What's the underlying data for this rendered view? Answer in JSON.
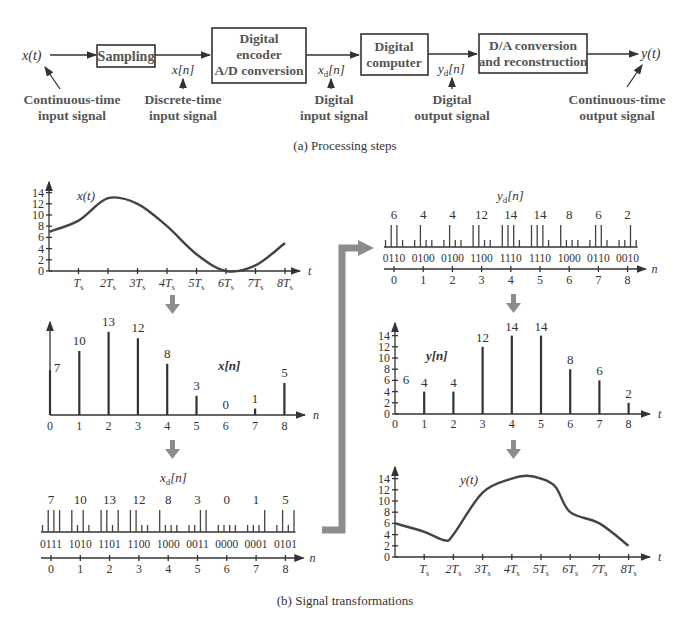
{
  "block_diagram": {
    "input_label": "x(t)",
    "output_label": "y(t)",
    "blocks": [
      {
        "id": "sampling",
        "lines": [
          "Sampling"
        ]
      },
      {
        "id": "encoder",
        "lines": [
          "Digital",
          "encoder",
          "A/D conversion"
        ]
      },
      {
        "id": "computer",
        "lines": [
          "Digital",
          "computer"
        ]
      },
      {
        "id": "dac",
        "lines": [
          "D/A conversion",
          "and reconstruction"
        ]
      }
    ],
    "signal_labels": {
      "xn": "x[n]",
      "xdn": "x",
      "xdn_sub": "d",
      "xdn_tail": "[n]",
      "ydn": "y",
      "ydn_sub": "d",
      "ydn_tail": "[n]"
    },
    "annotations": [
      {
        "id": "cont-input",
        "lines": [
          "Continuous-time",
          "input signal"
        ]
      },
      {
        "id": "disc-input",
        "lines": [
          "Discrete-time",
          "input signal"
        ]
      },
      {
        "id": "dig-input",
        "lines": [
          "Digital",
          "input signal"
        ]
      },
      {
        "id": "dig-output",
        "lines": [
          "Digital",
          "output signal"
        ]
      },
      {
        "id": "cont-output",
        "lines": [
          "Continuous-time",
          "output signal"
        ]
      }
    ],
    "caption": "(a)  Processing steps"
  },
  "transformations": {
    "caption": "(b)  Signal transformations",
    "y_ticks": [
      "0",
      "2",
      "4",
      "6",
      "8",
      "10",
      "12",
      "14"
    ],
    "n_ticks": [
      "0",
      "1",
      "2",
      "3",
      "4",
      "5",
      "6",
      "7",
      "8"
    ],
    "t_ticks": [
      "T",
      "2T",
      "3T",
      "4T",
      "5T",
      "6T",
      "7T",
      "8T"
    ],
    "t_tick_sub": "s",
    "t_axis": "t",
    "n_axis": "n",
    "xt_label": "x(t)",
    "xn_label": "x[n]",
    "xdn_label": "x",
    "xdn_label_sub": "d",
    "xdn_label_tail": "[n]",
    "ydn_label": "y",
    "ydn_label_sub": "d",
    "ydn_label_tail": "[n]",
    "yn_label": "y[n]",
    "yt_label": "y(t)"
  },
  "chart_data": [
    {
      "type": "line",
      "title": "x(t)",
      "xlabel": "t",
      "ylabel": "",
      "ylim": [
        0,
        14
      ],
      "x": [
        0,
        1,
        2,
        3,
        4,
        5,
        6,
        7,
        8
      ],
      "values": [
        7,
        9,
        13,
        12,
        8,
        3,
        0,
        1,
        5
      ]
    },
    {
      "type": "bar",
      "title": "x[n]",
      "xlabel": "n",
      "categories": [
        "0",
        "1",
        "2",
        "3",
        "4",
        "5",
        "6",
        "7",
        "8"
      ],
      "values": [
        7,
        10,
        13,
        12,
        8,
        3,
        0,
        1,
        5
      ]
    },
    {
      "type": "table",
      "title": "x_d[n]",
      "xlabel": "n",
      "categories": [
        "0",
        "1",
        "2",
        "3",
        "4",
        "5",
        "6",
        "7",
        "8"
      ],
      "values": [
        7,
        10,
        13,
        12,
        8,
        3,
        0,
        1,
        5
      ],
      "codes": [
        "0111",
        "1010",
        "1101",
        "1100",
        "1000",
        "0011",
        "0000",
        "0001",
        "0101"
      ]
    },
    {
      "type": "table",
      "title": "y_d[n]",
      "xlabel": "n",
      "categories": [
        "0",
        "1",
        "2",
        "3",
        "4",
        "5",
        "6",
        "7",
        "8"
      ],
      "values": [
        6,
        4,
        4,
        12,
        14,
        14,
        8,
        6,
        2
      ],
      "codes": [
        "0110",
        "0100",
        "0100",
        "1100",
        "1110",
        "1110",
        "1000",
        "0110",
        "0010"
      ]
    },
    {
      "type": "bar",
      "title": "y[n]",
      "xlabel": "t",
      "ylim": [
        0,
        14
      ],
      "categories": [
        "0",
        "1",
        "2",
        "3",
        "4",
        "5",
        "6",
        "7",
        "8"
      ],
      "values": [
        6,
        4,
        4,
        12,
        14,
        14,
        8,
        6,
        2
      ]
    },
    {
      "type": "line",
      "title": "y(t)",
      "xlabel": "t",
      "ylim": [
        0,
        14
      ],
      "x": [
        0,
        1,
        1.7,
        2,
        3,
        4,
        4.5,
        5,
        5.5,
        6,
        7,
        8
      ],
      "values": [
        6,
        4.5,
        3,
        4,
        11.5,
        14,
        14.5,
        14,
        12.5,
        8,
        6,
        2
      ]
    }
  ],
  "colors": {
    "ink": "#333333",
    "arrow_gray": "#8c8c8c",
    "label_gray": "#555555"
  }
}
